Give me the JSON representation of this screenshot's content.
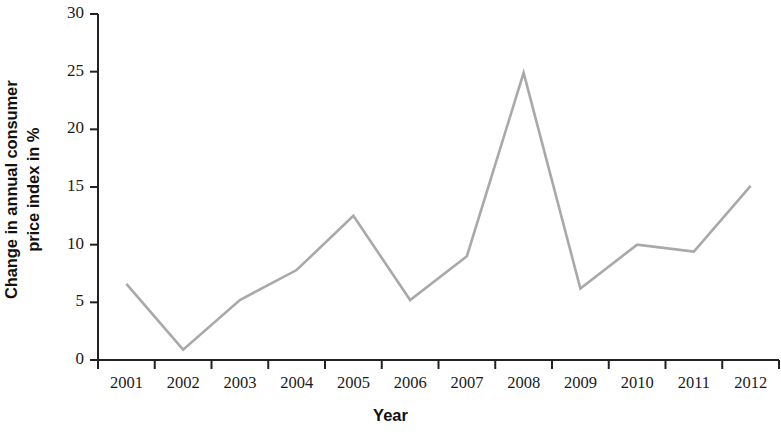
{
  "chart_data": {
    "type": "line",
    "title": "",
    "subtitle": "",
    "xlabel": "Year",
    "ylabel": "Change in annual consumer price index in %",
    "ylabel_line1": "Change in annual consumer",
    "ylabel_line2": "price index in %",
    "categories": [
      "2001",
      "2002",
      "2003",
      "2004",
      "2005",
      "2006",
      "2007",
      "2008",
      "2009",
      "2010",
      "2011",
      "2012"
    ],
    "values": [
      6.6,
      0.9,
      5.2,
      7.8,
      12.5,
      5.2,
      9.0,
      24.9,
      6.2,
      10.0,
      9.4,
      15.1
    ],
    "series": [
      {
        "name": "Change in annual consumer price index in %",
        "values": [
          6.6,
          0.9,
          5.2,
          7.8,
          12.5,
          5.2,
          9.0,
          24.9,
          6.2,
          10.0,
          9.4,
          15.1
        ]
      }
    ],
    "ylim": [
      0,
      30
    ],
    "yticks": [
      0,
      5,
      10,
      15,
      20,
      25,
      30
    ],
    "ytick_labels": [
      "0",
      "5",
      "10",
      "15",
      "20",
      "25",
      "30"
    ],
    "xlim": [
      0,
      12
    ],
    "grid": false,
    "legend": false,
    "legend_position": "none",
    "line_color": "#a9a9a9",
    "axis_color": "#222222",
    "text_color": "#1a1a1a",
    "background_color": "#ffffff"
  }
}
